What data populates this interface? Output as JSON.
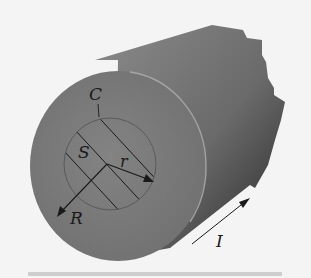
{
  "figure": {
    "labels": {
      "curve": "C",
      "surface": "S",
      "inner_radius": "r",
      "outer_radius": "R",
      "current": "I"
    },
    "colors": {
      "background": "#f4f4f4",
      "cylinder_face": "#7a7a7a",
      "cylinder_body_light": "#8a8a8a",
      "cylinder_body_dark": "#2e2e2e",
      "rim_highlight": "#b0b0b0",
      "lines": "#1a1a1a",
      "caption_bar": "#cfcfcf"
    }
  }
}
